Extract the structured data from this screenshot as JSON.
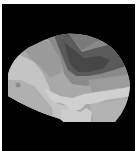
{
  "image": {
    "description": "Grayscale segmented topographic map of a rounded brain-like shape on black background",
    "background_color": "#000000",
    "border_color": "#ffffff",
    "region_colors": {
      "darkest": "#4a4a4a",
      "dark": "#5e5e5e",
      "mid_dark": "#767676",
      "mid": "#8e8e8e",
      "mid_light": "#a6a6a6",
      "light": "#bdbdbd",
      "lightest": "#d2d2d2"
    }
  }
}
